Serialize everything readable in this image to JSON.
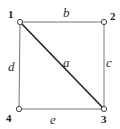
{
  "graph": {
    "nodes": [
      {
        "id": "1",
        "label": "1",
        "x": 20,
        "y": 22,
        "lx": 8,
        "ly": 18
      },
      {
        "id": "2",
        "label": "2",
        "x": 104,
        "y": 22,
        "lx": 110,
        "ly": 20
      },
      {
        "id": "3",
        "label": "3",
        "x": 104,
        "y": 109,
        "lx": 101,
        "ly": 123
      },
      {
        "id": "4",
        "label": "4",
        "x": 19,
        "y": 109,
        "lx": 6,
        "ly": 122
      }
    ],
    "edges": [
      {
        "id": "a",
        "label": "a",
        "from": "1",
        "to": "3",
        "lx": 63,
        "ly": 67,
        "width": 1.6,
        "color": "#222222"
      },
      {
        "id": "b",
        "label": "b",
        "from": "1",
        "to": "2",
        "lx": 63,
        "ly": 17,
        "width": 1,
        "color": "#777777"
      },
      {
        "id": "c",
        "label": "c",
        "from": "2",
        "to": "3",
        "lx": 106,
        "ly": 67,
        "width": 1,
        "color": "#777777"
      },
      {
        "id": "d",
        "label": "d",
        "from": "1",
        "to": "4",
        "lx": 8,
        "ly": 71,
        "width": 1,
        "color": "#777777"
      },
      {
        "id": "e",
        "label": "e",
        "from": "4",
        "to": "3",
        "lx": 50,
        "ly": 124,
        "width": 1,
        "color": "#777777"
      }
    ]
  }
}
